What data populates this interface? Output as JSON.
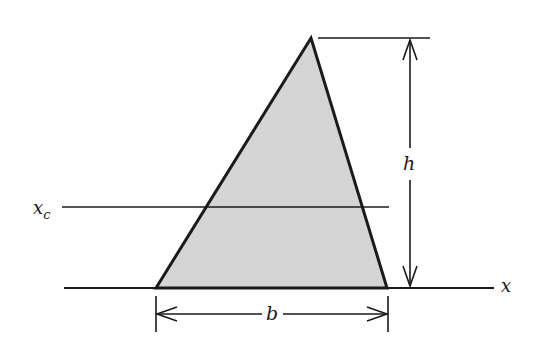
{
  "diagram": {
    "type": "triangle-centroid-geometry",
    "labels": {
      "centroid_axis": "x",
      "centroid_axis_subscript": "c",
      "height": "h",
      "base": "b",
      "x_axis": "x"
    },
    "colors": {
      "fill": "#d4d4d4",
      "stroke": "#1a1a1a",
      "background": "#ffffff"
    }
  }
}
